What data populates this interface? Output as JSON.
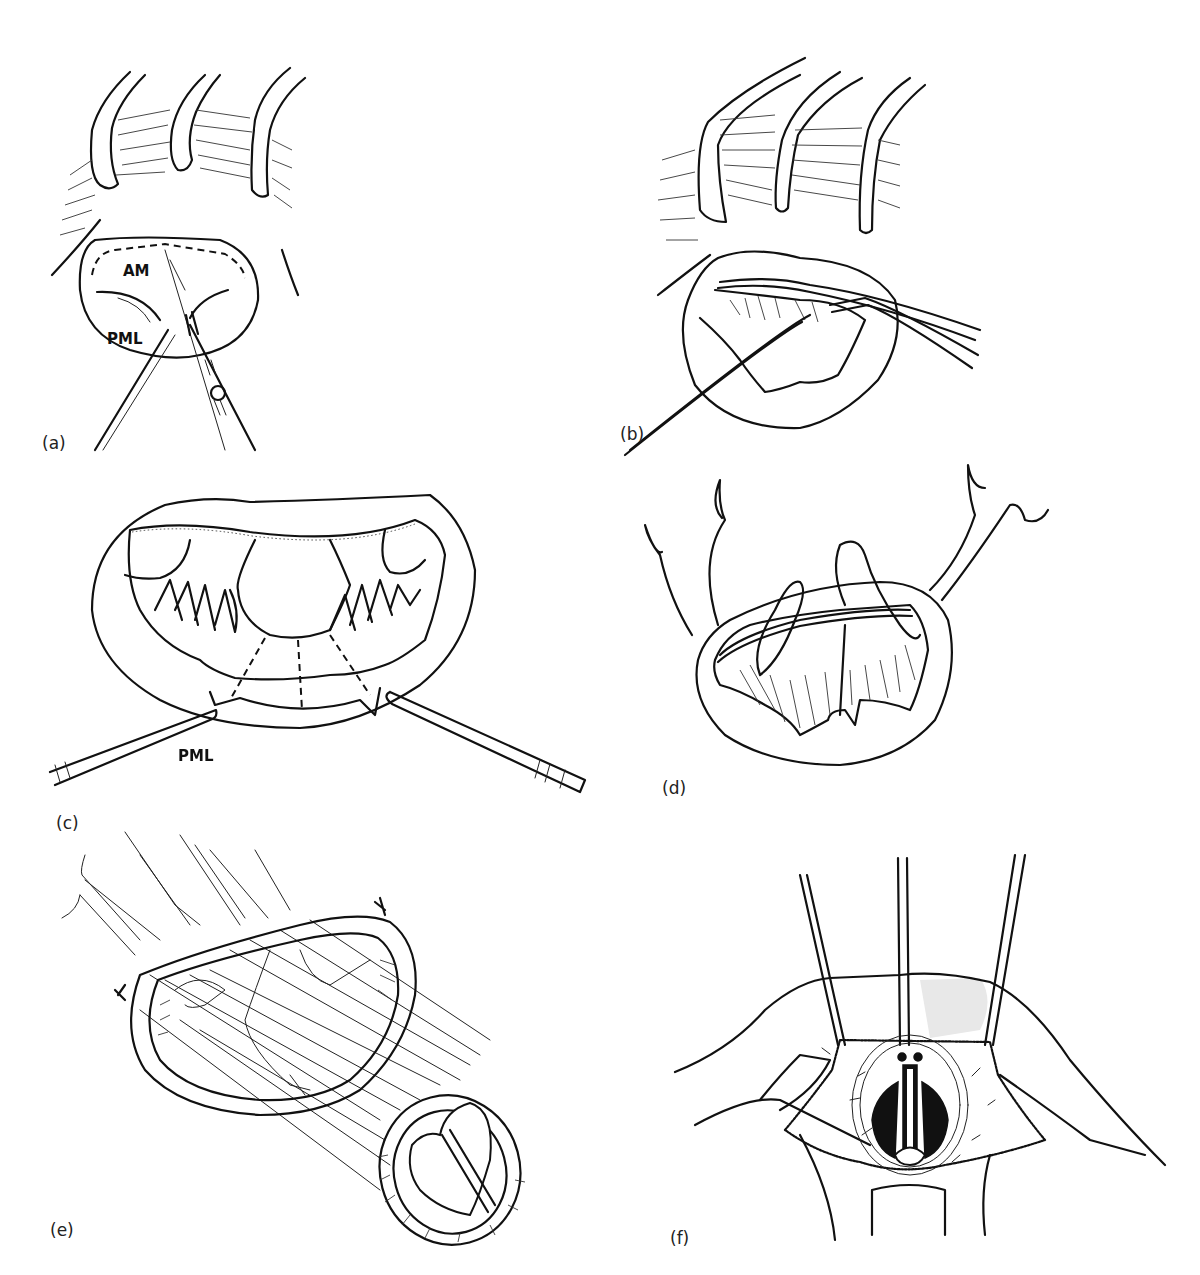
{
  "figure": {
    "panels": [
      {
        "id": "a",
        "label": "(a)",
        "annotations": [
          "AM",
          "PML"
        ]
      },
      {
        "id": "b",
        "label": "(b)",
        "annotations": []
      },
      {
        "id": "c",
        "label": "(c)",
        "annotations": []
      },
      {
        "id": "d",
        "label": "(d)",
        "annotations": [
          "PML"
        ]
      },
      {
        "id": "e",
        "label": "(e)",
        "annotations": []
      },
      {
        "id": "f",
        "label": "(f)",
        "annotations": []
      }
    ]
  },
  "colors": {
    "ink": "#111111",
    "background": "#ffffff",
    "shade": "#e8e8e8"
  }
}
